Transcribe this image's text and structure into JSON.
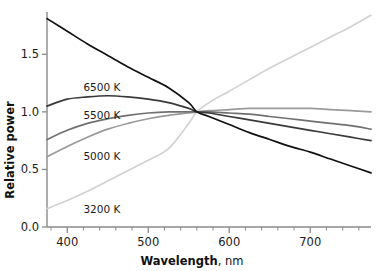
{
  "chart_data": {
    "type": "line",
    "title": "",
    "xlabel": "Wavelength",
    "xunit": "nm",
    "ylabel": "Relative power",
    "xlim": [
      375,
      775
    ],
    "ylim": [
      0.0,
      1.85
    ],
    "xticks": [
      400,
      500,
      600,
      700
    ],
    "xtick_labels": [
      "400",
      "500",
      "600",
      "700"
    ],
    "xtick_minor_step": 20,
    "yticks": [
      0.0,
      0.5,
      1.0,
      1.5
    ],
    "ytick_labels": [
      "0.0",
      "0.5",
      "1.0",
      "1.5"
    ],
    "grid": false,
    "legend": "inline-labels",
    "normalization_point": {
      "x": 560,
      "y": 1.0
    },
    "x": [
      375,
      400,
      425,
      450,
      475,
      500,
      525,
      550,
      560,
      575,
      600,
      625,
      650,
      675,
      700,
      725,
      750,
      775
    ],
    "series": [
      {
        "name": "9300 K",
        "label": "9300 K",
        "color": "#111111",
        "label_x": 112,
        "label_y": 1.78,
        "values": [
          1.81,
          1.7,
          1.59,
          1.49,
          1.39,
          1.3,
          1.21,
          1.08,
          1.0,
          0.96,
          0.89,
          0.82,
          0.76,
          0.7,
          0.65,
          0.59,
          0.53,
          0.47
        ]
      },
      {
        "name": "6500 K",
        "label": "6500 K",
        "color": "#3a3a3a",
        "label_x": 420,
        "label_y": 1.22,
        "values": [
          1.05,
          1.11,
          1.13,
          1.14,
          1.13,
          1.11,
          1.08,
          1.03,
          1.0,
          0.99,
          0.96,
          0.93,
          0.9,
          0.87,
          0.84,
          0.81,
          0.78,
          0.75
        ]
      },
      {
        "name": "5500 K",
        "label": "5500 K",
        "color": "#707070",
        "label_x": 420,
        "label_y": 0.97,
        "values": [
          0.76,
          0.84,
          0.9,
          0.94,
          0.97,
          0.99,
          1.0,
          1.0,
          1.0,
          1.0,
          0.99,
          0.98,
          0.96,
          0.94,
          0.92,
          0.9,
          0.88,
          0.85
        ]
      },
      {
        "name": "5000 K",
        "label": "5000 K",
        "color": "#9a9a9a",
        "label_x": 420,
        "label_y": 0.62,
        "values": [
          0.61,
          0.7,
          0.78,
          0.85,
          0.9,
          0.94,
          0.97,
          0.99,
          1.0,
          1.01,
          1.02,
          1.03,
          1.03,
          1.03,
          1.03,
          1.02,
          1.01,
          1.0
        ]
      },
      {
        "name": "3200 K",
        "label": "3200 K",
        "color": "#d2d2d2",
        "label_x": 420,
        "label_y": 0.16,
        "values": [
          0.16,
          0.23,
          0.31,
          0.4,
          0.49,
          0.58,
          0.68,
          0.9,
          1.0,
          1.08,
          1.18,
          1.28,
          1.38,
          1.47,
          1.56,
          1.65,
          1.74,
          1.84
        ]
      }
    ]
  }
}
